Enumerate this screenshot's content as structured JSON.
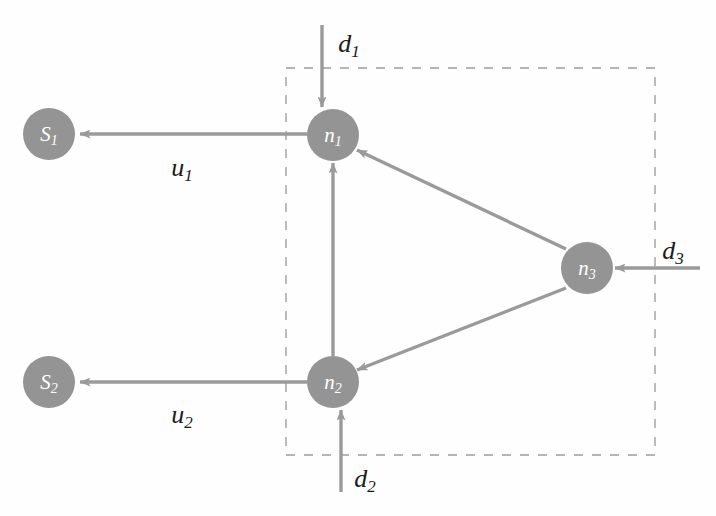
{
  "diagram": {
    "colors": {
      "node_fill": "#949494",
      "edge": "#9a9a9a",
      "boundary": "#b4b4b4",
      "node_text": "#ffffff",
      "label_text": "#1b1b1b",
      "background": "#fefefe"
    },
    "boundary": {
      "name": "dashed-boundary-box",
      "x": 286,
      "y": 68,
      "width": 369,
      "height": 387,
      "style": "dashed"
    },
    "nodes": [
      {
        "id": "s1",
        "base": "S",
        "sub": "1",
        "cx": 49,
        "cy": 134,
        "r": 26
      },
      {
        "id": "s2",
        "base": "S",
        "sub": "2",
        "cx": 49,
        "cy": 382,
        "r": 26
      },
      {
        "id": "n1",
        "base": "n",
        "sub": "1",
        "cx": 333,
        "cy": 135,
        "r": 26
      },
      {
        "id": "n2",
        "base": "n",
        "sub": "2",
        "cx": 333,
        "cy": 382,
        "r": 26
      },
      {
        "id": "n3",
        "base": "n",
        "sub": "3",
        "cx": 587,
        "cy": 268,
        "r": 26
      }
    ],
    "edges": [
      {
        "id": "n1-s1",
        "from": "n1",
        "to": "s1",
        "x1": 307,
        "y1": 134,
        "x2": 80,
        "y2": 134
      },
      {
        "id": "n2-s2",
        "from": "n2",
        "to": "s2",
        "x1": 307,
        "y1": 382,
        "x2": 80,
        "y2": 382
      },
      {
        "id": "n2-n1",
        "from": "n2",
        "to": "n1",
        "x1": 333,
        "y1": 356,
        "x2": 333,
        "y2": 163
      },
      {
        "id": "n3-n1",
        "from": "n3",
        "to": "n1",
        "x1": 566,
        "y1": 249,
        "x2": 357,
        "y2": 150
      },
      {
        "id": "n3-n2",
        "from": "n3",
        "to": "n2",
        "x1": 566,
        "y1": 288,
        "x2": 357,
        "y2": 370
      },
      {
        "id": "d1-in",
        "from": "external",
        "to": "n1",
        "x1": 322,
        "y1": 25,
        "x2": 322,
        "y2": 107
      },
      {
        "id": "d2-in",
        "from": "external",
        "to": "n2",
        "x1": 341,
        "y1": 492,
        "x2": 341,
        "y2": 410
      },
      {
        "id": "d3-in",
        "from": "external",
        "to": "n3",
        "x1": 700,
        "y1": 268,
        "x2": 615,
        "y2": 268
      }
    ],
    "edge_labels": [
      {
        "id": "u1",
        "base": "u",
        "sub": "1",
        "x": 182,
        "y": 167
      },
      {
        "id": "u2",
        "base": "u",
        "sub": "2",
        "x": 182,
        "y": 414
      },
      {
        "id": "d1",
        "base": "d",
        "sub": "1",
        "x": 349,
        "y": 43
      },
      {
        "id": "d2",
        "base": "d",
        "sub": "2",
        "x": 365,
        "y": 478
      },
      {
        "id": "d3",
        "base": "d",
        "sub": "3",
        "x": 673,
        "y": 250
      }
    ]
  }
}
